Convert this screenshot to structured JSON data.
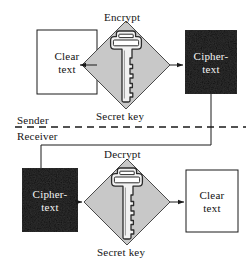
{
  "figure": {
    "kind": "symmetric-key-encryption-flow",
    "colors": {
      "diamond_fill": "#c8c8c8",
      "diamond_stroke": "#4a4a4a",
      "cipher_fill": "#0b0b0b",
      "clear_fill": "#ffffff",
      "stroke": "#1a1a1a",
      "key_fill": "#f2f2f2",
      "key_stroke": "#2b2b2b",
      "text_dark": "#151515",
      "text_light": "#f4f4f4"
    }
  },
  "sender": {
    "lane_label": "Sender",
    "input_box": {
      "line1": "Clear",
      "line2": "text"
    },
    "operation_label": "Encrypt",
    "key_label": "Secret key",
    "output_box": {
      "line1": "Cipher-",
      "line2": "text"
    }
  },
  "receiver": {
    "lane_label": "Receiver",
    "input_box": {
      "line1": "Cipher-",
      "line2": "text"
    },
    "operation_label": "Decrypt",
    "key_label": "Secret key",
    "output_box": {
      "line1": "Clear",
      "line2": "text"
    }
  },
  "divider": {
    "style": "dashed",
    "above_label": "Sender",
    "below_label": "Receiver"
  },
  "connections": [
    {
      "from": "sender.input_box",
      "to": "sender.operation",
      "arrow": true
    },
    {
      "from": "sender.operation",
      "to": "sender.output_box",
      "arrow": true
    },
    {
      "from": "sender.output_box",
      "to": "receiver.input_box",
      "arrow": false,
      "routing": "down-left-down-across-divider"
    },
    {
      "from": "receiver.input_box",
      "to": "receiver.operation",
      "arrow": true
    },
    {
      "from": "receiver.operation",
      "to": "receiver.output_box",
      "arrow": true
    }
  ]
}
